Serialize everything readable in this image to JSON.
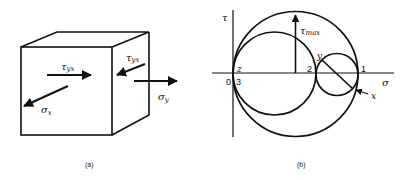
{
  "figure_a": {
    "caption": "(a)",
    "labels": {
      "tau_yx_front": "τ",
      "tau_yx_front_sub": "yx",
      "tau_yx_side": "τ",
      "tau_yx_side_sub": "yx",
      "sigma_x": "σ",
      "sigma_x_sub": "x",
      "sigma_y": "σ",
      "sigma_y_sub": "y"
    }
  },
  "figure_b": {
    "caption": "(b)",
    "axis_labels": {
      "vertical": "τ",
      "horizontal": "σ"
    },
    "labels": {
      "tau_max": "τ",
      "tau_max_sub": "max",
      "origin": "0",
      "z": "z",
      "three": "3",
      "two": "2",
      "one": "1",
      "y": "y",
      "x": "x"
    }
  },
  "colors": {
    "stroke": "#111111",
    "background": "#ffffff"
  }
}
